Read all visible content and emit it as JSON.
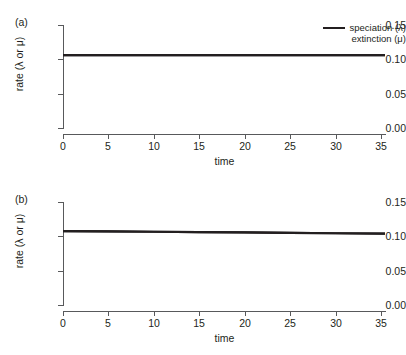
{
  "figure": {
    "background": "#ffffff",
    "line_color": "#231f20",
    "axis_color": "#58595b"
  },
  "legend": {
    "position": "top-right",
    "entries": [
      {
        "label": "speciation (λ)",
        "swatch": "line-swatch",
        "has_swatch": true
      },
      {
        "label": "extinction (μ)",
        "swatch": "line-swatch",
        "has_swatch": false
      }
    ]
  },
  "panels": [
    {
      "id": "a",
      "label": "(a)",
      "xlabel": "time",
      "ylabel": "rate (λ or μ)",
      "xticks": [
        "0",
        "5",
        "10",
        "15",
        "20",
        "25",
        "30",
        "35"
      ],
      "yticks": [
        "0.00",
        "0.05",
        "0.10",
        "0.15"
      ]
    },
    {
      "id": "b",
      "label": "(b)",
      "xlabel": "time",
      "ylabel": "rate (λ or μ)",
      "xticks": [
        "0",
        "5",
        "10",
        "15",
        "20",
        "25",
        "30",
        "35"
      ],
      "yticks": [
        "0.00",
        "0.05",
        "0.10",
        "0.15"
      ]
    }
  ],
  "chart_data": [
    {
      "type": "line",
      "panel": "a",
      "title": "(a)",
      "xlabel": "time",
      "ylabel": "rate (λ or μ)",
      "xlim": [
        0,
        35.5
      ],
      "ylim": [
        0.0,
        0.15
      ],
      "xticks": [
        0,
        5,
        10,
        15,
        20,
        25,
        30,
        35
      ],
      "yticks": [
        0.0,
        0.05,
        0.1,
        0.15
      ],
      "grid": false,
      "legend_position": "top-right",
      "series": [
        {
          "name": "speciation (λ)",
          "x": [
            0,
            5,
            10,
            15,
            20,
            25,
            30,
            35.5
          ],
          "values": [
            0.106,
            0.106,
            0.106,
            0.106,
            0.106,
            0.106,
            0.106,
            0.106
          ],
          "color": "#231f20"
        },
        {
          "name": "extinction (μ)",
          "x": [
            0,
            5,
            10,
            15,
            20,
            25,
            30,
            35.5
          ],
          "values": [
            0.106,
            0.106,
            0.106,
            0.106,
            0.106,
            0.106,
            0.106,
            0.106
          ],
          "color": "#231f20",
          "note": "overlaps speciation line"
        }
      ]
    },
    {
      "type": "line",
      "panel": "b",
      "title": "(b)",
      "xlabel": "time",
      "ylabel": "rate (λ or μ)",
      "xlim": [
        0,
        35.5
      ],
      "ylim": [
        0.0,
        0.15
      ],
      "xticks": [
        0,
        5,
        10,
        15,
        20,
        25,
        30,
        35
      ],
      "yticks": [
        0.0,
        0.05,
        0.1,
        0.15
      ],
      "grid": false,
      "legend_position": "none",
      "series": [
        {
          "name": "speciation (λ)",
          "x": [
            0,
            5,
            10,
            15,
            20,
            25,
            30,
            35.5
          ],
          "values": [
            0.1075,
            0.1071,
            0.1067,
            0.1062,
            0.1057,
            0.1051,
            0.1045,
            0.1038
          ],
          "color": "#231f20"
        },
        {
          "name": "extinction (μ)",
          "x": [
            0,
            5,
            10,
            15,
            20,
            25,
            30,
            35.5
          ],
          "values": [
            0.1075,
            0.1071,
            0.1067,
            0.1062,
            0.1057,
            0.1051,
            0.1045,
            0.1038
          ],
          "color": "#231f20",
          "note": "overlaps speciation line"
        }
      ]
    }
  ]
}
